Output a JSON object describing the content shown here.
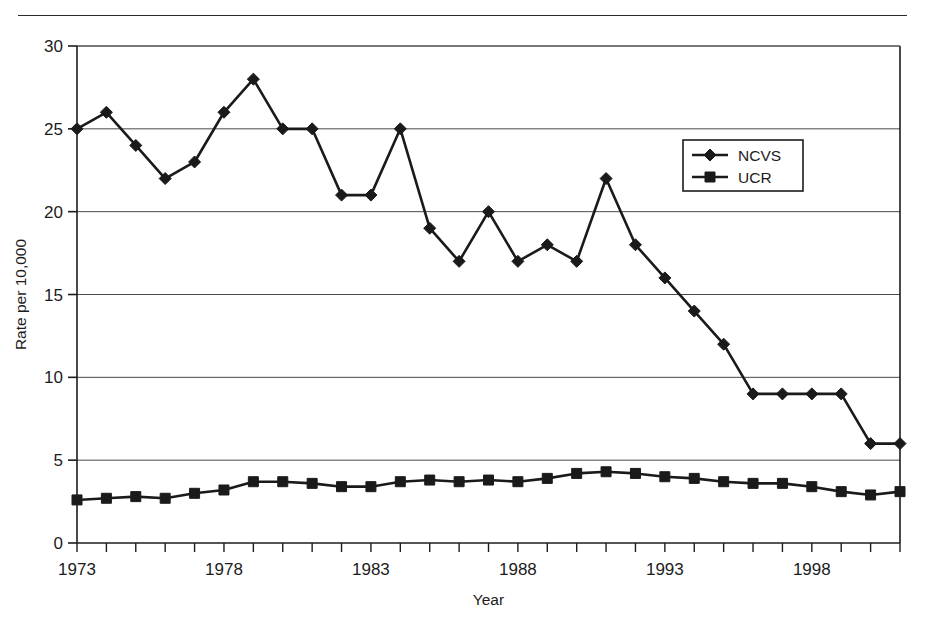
{
  "chart_data": {
    "type": "line",
    "title": "",
    "xlabel": "Year",
    "ylabel": "Rate per 10,000",
    "xlim": [
      1973,
      2001
    ],
    "ylim": [
      0,
      30
    ],
    "yticks": [
      0,
      5,
      10,
      15,
      20,
      25,
      30
    ],
    "ytick_labels": [
      "0",
      "5",
      "10",
      "15",
      "20",
      "25",
      "30"
    ],
    "xticks": [
      1973,
      1978,
      1983,
      1988,
      1993,
      1998
    ],
    "xtick_labels": [
      "1973",
      "1978",
      "1983",
      "1988",
      "1993",
      "1998"
    ],
    "x": [
      1973,
      1974,
      1975,
      1976,
      1977,
      1978,
      1979,
      1980,
      1981,
      1982,
      1983,
      1984,
      1985,
      1986,
      1987,
      1988,
      1989,
      1990,
      1991,
      1992,
      1993,
      1994,
      1995,
      1996,
      1997,
      1998,
      1999,
      2000,
      2001
    ],
    "grid": "horizontal",
    "legend_position": "upper-right",
    "series": [
      {
        "name": "NCVS",
        "marker": "diamond",
        "color": "#1a1a1a",
        "values": [
          25,
          26,
          24,
          22,
          23,
          26,
          28,
          25,
          25,
          21,
          21,
          25,
          19,
          17,
          20,
          17,
          18,
          17,
          22,
          18,
          16,
          14,
          12,
          9,
          9,
          9,
          9,
          6,
          6
        ]
      },
      {
        "name": "UCR",
        "marker": "square",
        "color": "#1a1a1a",
        "values": [
          2.6,
          2.7,
          2.8,
          2.7,
          3.0,
          3.2,
          3.7,
          3.7,
          3.6,
          3.4,
          3.4,
          3.7,
          3.8,
          3.7,
          3.8,
          3.7,
          3.9,
          4.2,
          4.3,
          4.2,
          4.0,
          3.9,
          3.7,
          3.6,
          3.6,
          3.4,
          3.1,
          2.9,
          3.1
        ]
      }
    ]
  },
  "legend": {
    "entries": [
      {
        "label": "NCVS"
      },
      {
        "label": "UCR"
      }
    ]
  },
  "axes": {
    "y_title": "Rate per 10,000",
    "x_title": "Year"
  }
}
